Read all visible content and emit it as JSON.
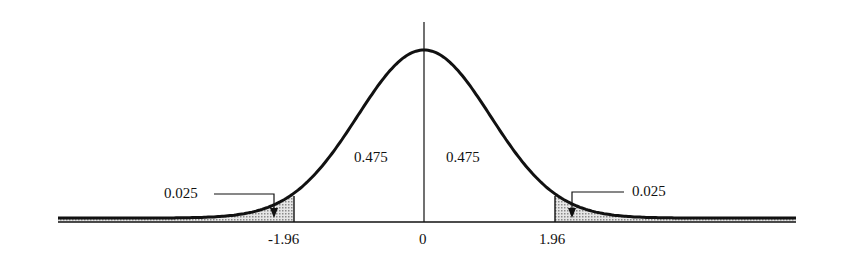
{
  "chart_data": {
    "type": "area",
    "title": "",
    "xlabel": "",
    "ylabel": "",
    "x_ticks": [
      "-1.96",
      "0",
      "1.96"
    ],
    "x_tick_values": [
      -1.96,
      0,
      1.96
    ],
    "regions": [
      {
        "name": "left-tail",
        "range": [
          null,
          -1.96
        ],
        "area": 0.025,
        "shaded": true
      },
      {
        "name": "left-center",
        "range": [
          -1.96,
          0
        ],
        "area": 0.475,
        "shaded": false
      },
      {
        "name": "right-center",
        "range": [
          0,
          1.96
        ],
        "area": 0.475,
        "shaded": false
      },
      {
        "name": "right-tail",
        "range": [
          1.96,
          null
        ],
        "area": 0.025,
        "shaded": true
      }
    ],
    "annotations": [
      "0.025",
      "0.475",
      "0.475",
      "0.025"
    ],
    "grid": false,
    "legend": null
  },
  "labels": {
    "left_tail": "0.025",
    "right_tail": "0.025",
    "left_center": "0.475",
    "right_center": "0.475",
    "tick_neg": "-1.96",
    "tick_zero": "0",
    "tick_pos": "1.96"
  },
  "colors": {
    "curve": "#111111",
    "shade": "#bdbdbd"
  }
}
